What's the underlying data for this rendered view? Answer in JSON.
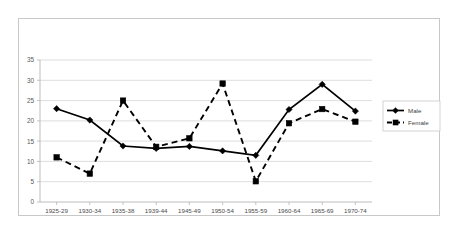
{
  "chart_data": {
    "type": "line",
    "title": "",
    "subtitle": "",
    "xlabel": "",
    "ylabel": "",
    "categories": [
      "1925-29",
      "1930-34",
      "1935-38",
      "1939-44",
      "1945-49",
      "1950-54",
      "1955-59",
      "1960-64",
      "1965-69",
      "1970-74"
    ],
    "series": [
      {
        "name": "Male",
        "marker": "diamond",
        "linestyle": "solid",
        "color": "#000000",
        "values": [
          23.0,
          20.2,
          13.8,
          13.2,
          13.7,
          12.6,
          11.5,
          22.8,
          29.0,
          22.4
        ]
      },
      {
        "name": "Female",
        "marker": "square",
        "linestyle": "dashed",
        "color": "#000000",
        "values": [
          11.0,
          7.0,
          25.0,
          13.6,
          15.7,
          29.2,
          5.1,
          19.4,
          22.9,
          19.8
        ]
      }
    ],
    "ylim": [
      0,
      35
    ],
    "yticks": [
      0,
      5,
      10,
      15,
      20,
      25,
      30,
      35
    ],
    "ytick_labels": [
      "0",
      "5",
      "10",
      "15",
      "20",
      "25",
      "30",
      "35"
    ],
    "grid": true,
    "grid_axis": "y",
    "legend_position": "right",
    "legend_entries": [
      "Male",
      "Female"
    ],
    "plot_background": "#ffffff",
    "border_color": "#c8c8c8"
  }
}
